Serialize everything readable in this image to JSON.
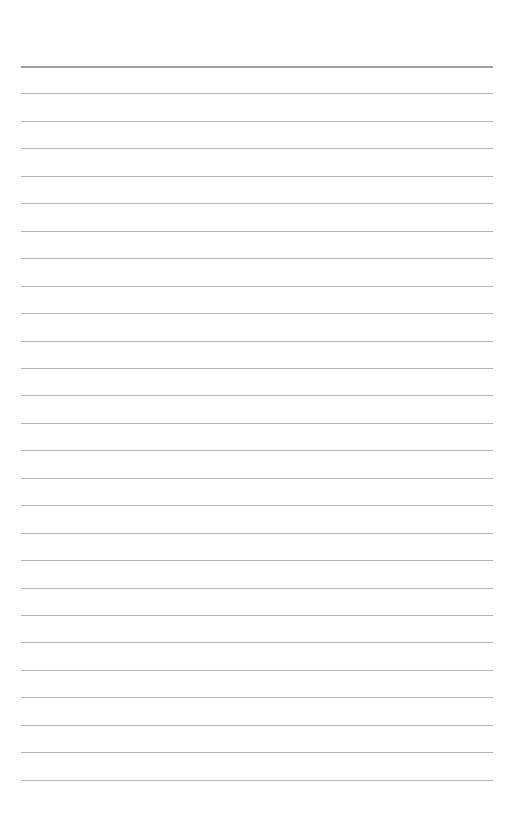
{
  "page": {
    "type": "lined-paper",
    "background": "#ffffff",
    "rule_color": "#b4b4b4",
    "top_rule_color": "#a0a0a0",
    "rule_count": 27,
    "first_rule_y": 66,
    "rule_spacing": 27.45,
    "rule_left": 21,
    "rule_right": 493
  }
}
